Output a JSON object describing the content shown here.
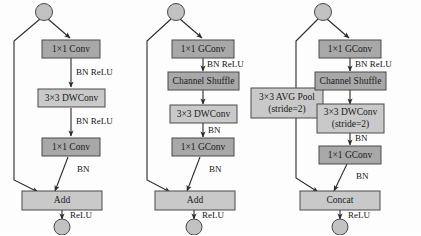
{
  "figure": {
    "kind": "neural-network-block-diagram",
    "panel_count": 3,
    "colors": {
      "box_dark": "#a8a8a8",
      "box_light": "#c9c9c9",
      "box_stroke": "#4a4a4a",
      "circle_fill": "#c2c2c2",
      "line": "#2b2b2b",
      "text": "#141414",
      "background": "#fdfdfd"
    }
  },
  "panels": [
    {
      "id": "panel-a",
      "name": "mobilenet-residual-block",
      "start_node": "input-node",
      "end_node": "output-node",
      "blocks": [
        {
          "id": "a1",
          "label": "1×1  Conv",
          "sublabel": "",
          "shade": "dark"
        },
        {
          "id": "a2",
          "label": "3×3 DWConv",
          "sublabel": "",
          "shade": "light"
        },
        {
          "id": "a3",
          "label": "1×1  Conv",
          "sublabel": "",
          "shade": "dark"
        },
        {
          "id": "a4",
          "label": "Add",
          "sublabel": "",
          "shade": "light"
        }
      ],
      "edge_labels": [
        {
          "id": "a-e1",
          "text": "BN ReLU"
        },
        {
          "id": "a-e2",
          "text": "BN ReLU"
        },
        {
          "id": "a-e3",
          "text": "BN"
        },
        {
          "id": "a-e4",
          "text": "ReLU"
        }
      ]
    },
    {
      "id": "panel-b",
      "name": "shufflenet-unit-stride1",
      "start_node": "input-node",
      "end_node": "output-node",
      "blocks": [
        {
          "id": "b1",
          "label": "1×1  GConv",
          "sublabel": "",
          "shade": "dark"
        },
        {
          "id": "b2",
          "label": "Channel Shuffle",
          "sublabel": "",
          "shade": "dark"
        },
        {
          "id": "b3",
          "label": "3×3 DWConv",
          "sublabel": "",
          "shade": "light"
        },
        {
          "id": "b4",
          "label": "1×1  GConv",
          "sublabel": "",
          "shade": "dark"
        },
        {
          "id": "b5",
          "label": "Add",
          "sublabel": "",
          "shade": "light"
        }
      ],
      "edge_labels": [
        {
          "id": "b-e1",
          "text": "BN ReLU"
        },
        {
          "id": "b-e2",
          "text": "BN"
        },
        {
          "id": "b-e3",
          "text": "BN"
        },
        {
          "id": "b-e4",
          "text": "ReLU"
        }
      ]
    },
    {
      "id": "panel-c",
      "name": "shufflenet-unit-stride2",
      "start_node": "input-node",
      "end_node": "output-node",
      "blocks": [
        {
          "id": "c0",
          "label": "3×3 AVG Pool",
          "sublabel": "(stride=2)",
          "shade": "light"
        },
        {
          "id": "c1",
          "label": "1×1  GConv",
          "sublabel": "",
          "shade": "dark"
        },
        {
          "id": "c2",
          "label": "Channel Shuffle",
          "sublabel": "",
          "shade": "dark"
        },
        {
          "id": "c3",
          "label": "3×3 DWConv",
          "sublabel": "(stride=2)",
          "shade": "light"
        },
        {
          "id": "c4",
          "label": "1×1  GConv",
          "sublabel": "",
          "shade": "dark"
        },
        {
          "id": "c5",
          "label": "Concat",
          "sublabel": "",
          "shade": "light"
        }
      ],
      "edge_labels": [
        {
          "id": "c-e1",
          "text": "BN ReLU"
        },
        {
          "id": "c-e2",
          "text": "BN"
        },
        {
          "id": "c-e3",
          "text": "BN"
        },
        {
          "id": "c-e4",
          "text": "ReLU"
        }
      ]
    }
  ]
}
